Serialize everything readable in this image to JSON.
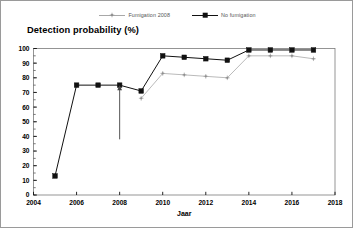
{
  "chart_data": {
    "type": "line",
    "title": "Detection probability (%)",
    "xlabel": "Jaar",
    "ylabel": "",
    "xlim": [
      2004,
      2018
    ],
    "ylim": [
      0,
      100
    ],
    "xticks": [
      2004,
      2006,
      2008,
      2010,
      2012,
      2014,
      2016,
      2018
    ],
    "yticks": [
      0,
      10,
      20,
      30,
      40,
      50,
      60,
      70,
      80,
      90,
      100
    ],
    "yticks_minor_step": 5,
    "grid": false,
    "legend_position": "top-center",
    "series": [
      {
        "name": "Fumigation 2008",
        "color": "#a8a8a8",
        "marker": "plus-dot",
        "x": [
          2009,
          2010,
          2011,
          2012,
          2013,
          2014,
          2015,
          2016,
          2017
        ],
        "values": [
          66,
          83,
          82,
          81,
          80,
          95,
          95,
          95,
          93
        ]
      },
      {
        "name": "No fumigation",
        "color": "#111111",
        "marker": "square",
        "x": [
          2005,
          2006,
          2007,
          2008,
          2009,
          2010,
          2011,
          2012,
          2013,
          2014,
          2015,
          2016,
          2017
        ],
        "values": [
          13,
          75,
          75,
          75,
          71,
          95,
          94,
          93,
          92,
          99,
          99,
          99,
          99
        ]
      }
    ],
    "annotations": [
      {
        "type": "arrow",
        "label": "",
        "x": 2008,
        "y_from": 38,
        "y_to": 75,
        "direction": "up",
        "color": "#444444"
      }
    ]
  },
  "legend": {
    "items": [
      {
        "label": "Fumigation 2008"
      },
      {
        "label": "No fumigation"
      }
    ]
  }
}
